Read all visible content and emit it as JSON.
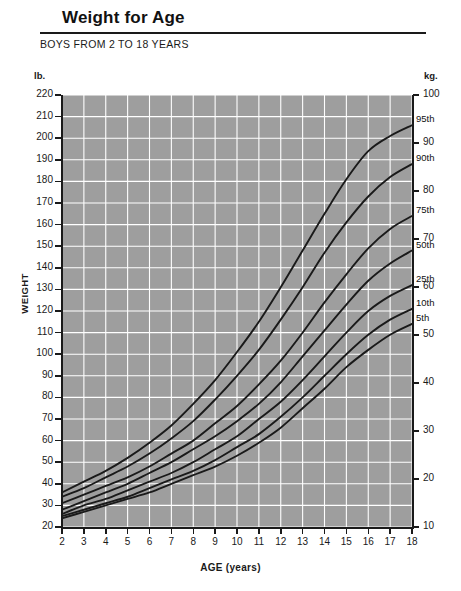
{
  "header": {
    "title": "Weight for Age",
    "subtitle": "BOYS FROM 2 TO 18 YEARS"
  },
  "units": {
    "left": "lb.",
    "right": "kg."
  },
  "chart_data": {
    "type": "line",
    "title": "Weight for Age",
    "subtitle": "BOYS FROM 2 TO 18 YEARS",
    "xlabel": "AGE (years)",
    "ylabel": "WEIGHT",
    "y_unit_left": "lb.",
    "y_unit_right": "kg.",
    "xlim": [
      2,
      18
    ],
    "ylim": [
      20,
      220
    ],
    "ylim_right": [
      10,
      100
    ],
    "grid": true,
    "legend_position": "right-inline",
    "background_color": "#9e9e9e",
    "gridline_color": "#ffffff",
    "curve_color": "#1a1a1a",
    "x_ticks": [
      2,
      3,
      4,
      5,
      6,
      7,
      8,
      9,
      10,
      11,
      12,
      13,
      14,
      15,
      16,
      17,
      18
    ],
    "y_ticks_left": [
      20,
      30,
      40,
      50,
      60,
      70,
      80,
      90,
      100,
      110,
      120,
      130,
      140,
      150,
      160,
      170,
      180,
      190,
      200,
      210,
      220
    ],
    "y_ticks_right": [
      10,
      20,
      30,
      40,
      50,
      60,
      70,
      80,
      90,
      100
    ],
    "x": [
      2,
      3,
      4,
      5,
      6,
      7,
      8,
      9,
      10,
      11,
      12,
      13,
      14,
      15,
      16,
      17,
      18
    ],
    "series": [
      {
        "name": "95th",
        "label": "95th",
        "values": [
          36,
          41,
          46,
          52,
          59,
          67,
          77,
          88,
          101,
          115,
          131,
          148,
          165,
          181,
          194,
          201,
          206
        ]
      },
      {
        "name": "90th",
        "label": "90th",
        "values": [
          34,
          38,
          43,
          48,
          54,
          61,
          69,
          79,
          90,
          102,
          116,
          131,
          147,
          161,
          173,
          182,
          188
        ]
      },
      {
        "name": "75th",
        "label": "75th",
        "values": [
          31,
          35,
          39,
          43,
          48,
          54,
          60,
          68,
          76,
          86,
          97,
          110,
          124,
          137,
          149,
          158,
          164
        ]
      },
      {
        "name": "50th",
        "label": "50th",
        "values": [
          28,
          32,
          36,
          40,
          45,
          50,
          56,
          62,
          69,
          77,
          87,
          99,
          111,
          123,
          134,
          142,
          148
        ]
      },
      {
        "name": "25th",
        "label": "25th",
        "values": [
          26,
          30,
          33,
          37,
          41,
          45,
          50,
          56,
          62,
          70,
          78,
          88,
          99,
          110,
          120,
          127,
          132
        ]
      },
      {
        "name": "10th",
        "label": "10th",
        "values": [
          25,
          28,
          31,
          34,
          38,
          42,
          46,
          51,
          57,
          63,
          71,
          80,
          90,
          100,
          109,
          116,
          121
        ]
      },
      {
        "name": "5th",
        "label": "5th",
        "values": [
          24,
          27,
          30,
          33,
          36,
          40,
          44,
          48,
          53,
          59,
          66,
          75,
          84,
          94,
          102,
          109,
          114
        ]
      }
    ]
  }
}
